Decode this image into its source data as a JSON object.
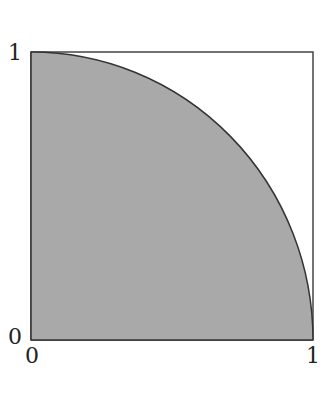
{
  "diagram": {
    "title": "",
    "labels": {
      "y_top": "1",
      "y_origin": "0",
      "x_origin": "0",
      "x_right": "1"
    },
    "colors": {
      "fill": "#a9a9a9",
      "stroke": "#333333",
      "background": "#ffffff"
    }
  }
}
